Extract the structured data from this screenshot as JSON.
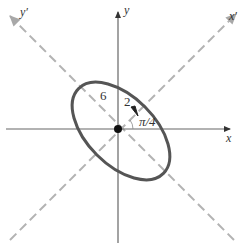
{
  "diagram": {
    "center": {
      "x": 118,
      "y": 129
    },
    "axes": {
      "x_label": "x",
      "y_label": "y",
      "x_prime_label": "x′",
      "y_prime_label": "y′"
    },
    "ellipse": {
      "semi_major_label": "6",
      "semi_minor_label": "2",
      "rotation_label": "π/4"
    },
    "colors": {
      "axis": "#555555",
      "rotated_axis": "#b3b3b3",
      "ellipse": "#555555",
      "label": "#333333"
    }
  }
}
